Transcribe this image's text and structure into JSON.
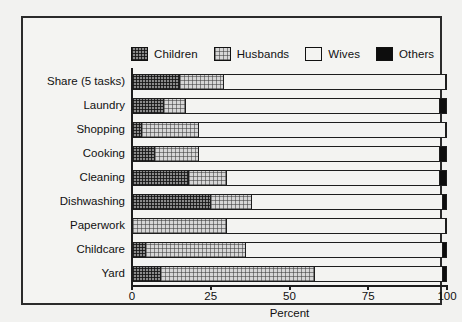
{
  "chart_data": {
    "type": "bar",
    "orientation": "horizontal",
    "stacked": true,
    "title": "",
    "xlabel": "Percent",
    "ylabel": "",
    "xlim": [
      0,
      100
    ],
    "xticks": [
      0,
      25,
      50,
      75,
      100
    ],
    "xticklabels": [
      "0",
      "25",
      "50",
      "75",
      "100"
    ],
    "grid": false,
    "legend_position": "top",
    "categories": [
      "Share (5 tasks)",
      "Laundry",
      "Shopping",
      "Cooking",
      "Cleaning",
      "Dishwashing",
      "Paperwork",
      "Childcare",
      "Yard"
    ],
    "series": [
      {
        "name": "Children",
        "color": "#8b8b8b",
        "pattern": "dark-checker",
        "values": [
          15,
          10,
          3,
          7,
          18,
          25,
          0,
          4,
          9
        ]
      },
      {
        "name": "Husbands",
        "color": "#d6d6d6",
        "pattern": "light-checker",
        "values": [
          14,
          7,
          18,
          14,
          12,
          13,
          30,
          32,
          49
        ]
      },
      {
        "name": "Wives",
        "color": "#f3f3f1",
        "pattern": "solid-white",
        "values": [
          71,
          81,
          79,
          77,
          68,
          61,
          70,
          63,
          41
        ]
      },
      {
        "name": "Others",
        "color": "#0d0d0d",
        "pattern": "solid-black",
        "values": [
          0,
          2,
          0,
          2,
          2,
          1,
          0,
          1,
          1
        ]
      }
    ]
  },
  "legend": {
    "items": [
      {
        "label": "Children",
        "swatch": "children-swatch"
      },
      {
        "label": "Husbands",
        "swatch": "husbands-swatch"
      },
      {
        "label": "Wives",
        "swatch": "wives-swatch"
      },
      {
        "label": "Others",
        "swatch": "others-swatch"
      }
    ]
  }
}
